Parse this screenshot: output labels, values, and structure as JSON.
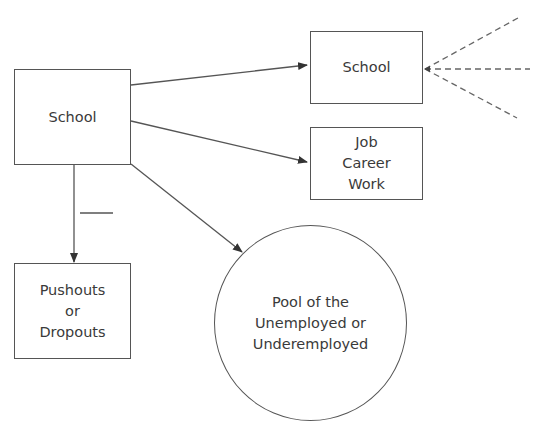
{
  "diagram": {
    "nodes": {
      "school_source": {
        "label": "School"
      },
      "school_next": {
        "label": "School"
      },
      "job": {
        "label": "Job\nCareer\nWork"
      },
      "pushouts": {
        "label": "Pushouts\nor\nDropouts"
      },
      "pool": {
        "label": "Pool of the\nUnemployed or\nUnderemployed"
      }
    },
    "edges": [
      {
        "from": "school_source",
        "to": "school_next",
        "style": "solid-arrow"
      },
      {
        "from": "school_source",
        "to": "job",
        "style": "solid-arrow"
      },
      {
        "from": "school_source",
        "to": "pool",
        "style": "solid-arrow"
      },
      {
        "from": "school_source",
        "to": "pushouts",
        "style": "solid-arrow",
        "marker": "minus"
      },
      {
        "from": "external",
        "to": "school_next",
        "style": "dashed",
        "count": 3
      }
    ],
    "colors": {
      "line": "#555555",
      "text": "#3a3a3a",
      "dashed": "#666666"
    }
  }
}
